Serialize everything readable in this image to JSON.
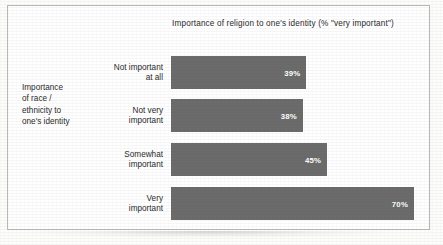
{
  "chart_data": {
    "type": "bar",
    "orientation": "horizontal",
    "title": "Importance of religion to one's identity (% \"very important\")",
    "ylabel": "Importance of race / ethnicity to one's identity",
    "xlabel": "",
    "categories": [
      "Not important\nat all",
      "Not very\nimportant",
      "Somewhat\nimportant",
      "Very\nimportant"
    ],
    "values": [
      39,
      38,
      45,
      70
    ],
    "value_labels": [
      "39%",
      "38%",
      "45%",
      "70%"
    ],
    "xlim": [
      0,
      72
    ],
    "grid": false,
    "legend": false,
    "bar_color": "#6b6b6b",
    "value_label_color": "#ffffff",
    "text_color": "#2a2a2a",
    "frame_color": "#b9b9b9"
  },
  "axis": {
    "y_label_lines": [
      "Importance",
      "of race /",
      "ethnicity to",
      "one's identity"
    ]
  },
  "bars": [
    {
      "label_line1": "Not important",
      "label_line2": "at all",
      "value_label": "39%",
      "width_px": "135px"
    },
    {
      "label_line1": "Not very",
      "label_line2": "important",
      "value_label": "38%",
      "width_px": "132px"
    },
    {
      "label_line1": "Somewhat",
      "label_line2": "important",
      "value_label": "45px_placeholder",
      "width_px": "156px"
    },
    {
      "label_line1": "Very",
      "label_line2": "important",
      "value_label": "70%",
      "width_px": "243px"
    }
  ],
  "bar_value_labels": [
    "39%",
    "38%",
    "45%",
    "70%"
  ],
  "bar_widths": [
    "135px",
    "132px",
    "156px",
    "243px"
  ],
  "bar_tops": [
    "50px",
    "93px",
    "137px",
    "181px"
  ]
}
